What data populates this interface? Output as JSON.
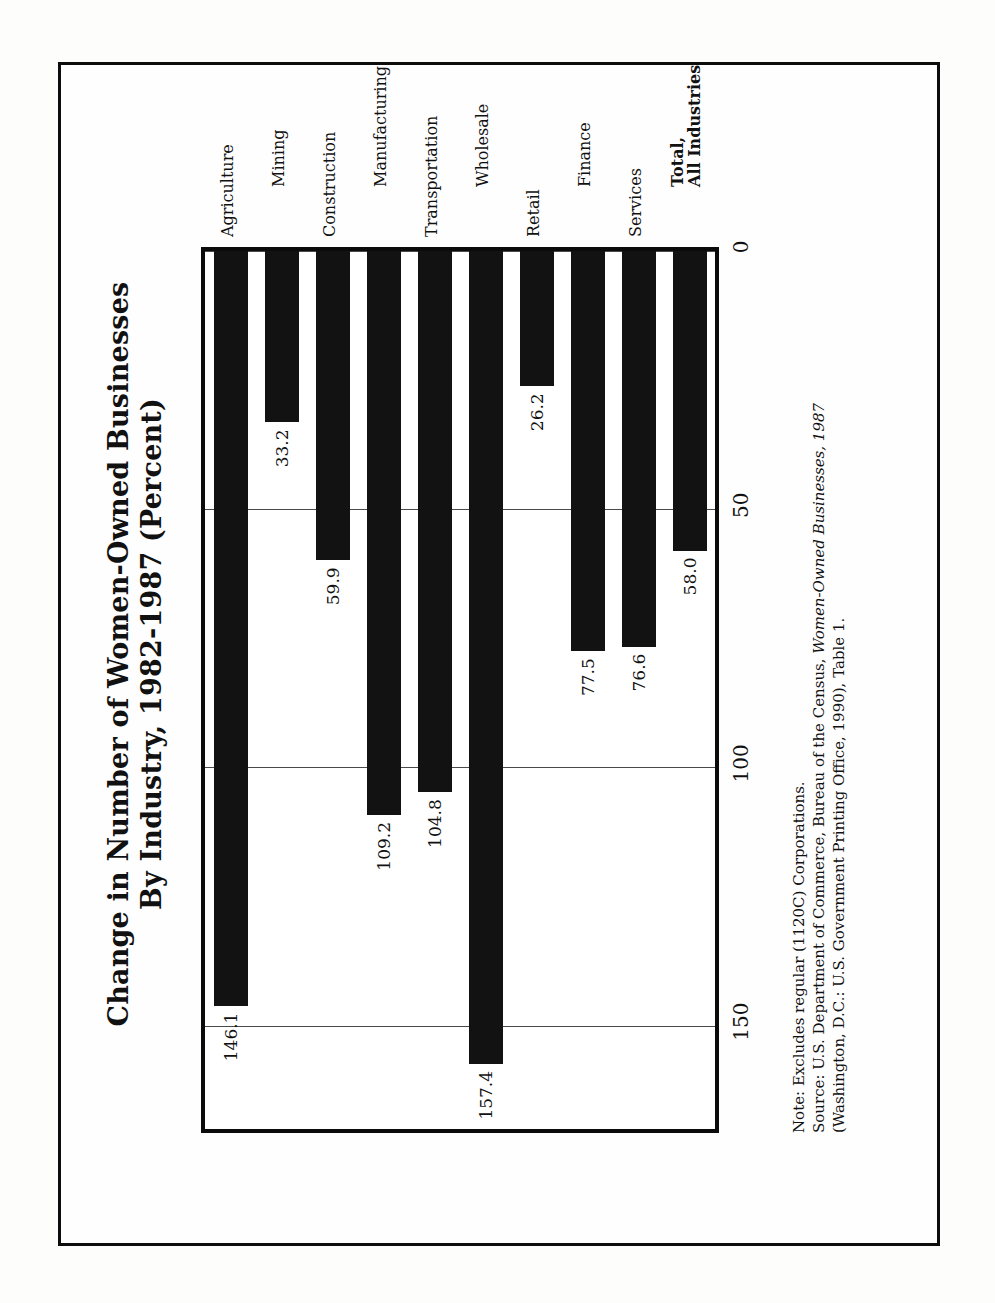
{
  "figure": {
    "title_line1": "Change in Number of Women-Owned Businesses",
    "title_line2": "By Industry, 1982-1987 (Percent)"
  },
  "notes": {
    "note": "Note: Excludes regular (1120C) Corporations.",
    "source_prefix": "Source: U.S. Department of Commerce, Bureau of the Census, ",
    "source_italic": "Women-Owned Businesses, 1987",
    "source_line2": "(Washington, D.C.: U.S. Government Printing Office, 1990), Table 1."
  },
  "chart_data": {
    "type": "bar",
    "orientation": "horizontal",
    "title": "Change in Number of Women-Owned Businesses By Industry, 1982-1987 (Percent)",
    "xlabel": "",
    "ylabel": "",
    "grid": true,
    "legend": "none",
    "axis_ticks": [
      "150",
      "100",
      "50",
      "0"
    ],
    "axis_tick_values": [
      150,
      100,
      50,
      0
    ],
    "xlim": [
      0,
      170
    ],
    "categories": [
      "Agriculture",
      "Mining",
      "Construction",
      "Manufacturing",
      "Transportation",
      "Wholesale",
      "Retail",
      "Finance",
      "Services",
      "Total,\nAll Industries"
    ],
    "values": [
      146.1,
      33.2,
      59.9,
      109.2,
      104.8,
      157.4,
      26.2,
      77.5,
      76.6,
      58.0
    ],
    "data_labels": [
      "146.1",
      "33.2",
      "59.9",
      "109.2",
      "104.8",
      "157.4",
      "26.2",
      "77.5",
      "76.6",
      "58.0"
    ],
    "bar_color": "#121212",
    "categories_display": [
      {
        "label": "Agriculture",
        "row": 1,
        "bold": false
      },
      {
        "label": "Mining",
        "row": 2,
        "bold": false
      },
      {
        "label": "Construction",
        "row": 1,
        "bold": false
      },
      {
        "label": "Manufacturing",
        "row": 2,
        "bold": false
      },
      {
        "label": "Transportation",
        "row": 1,
        "bold": false
      },
      {
        "label": "Wholesale",
        "row": 2,
        "bold": false
      },
      {
        "label": "Retail",
        "row": 1,
        "bold": false
      },
      {
        "label": "Finance",
        "row": 2,
        "bold": false
      },
      {
        "label": "Services",
        "row": 1,
        "bold": false
      },
      {
        "label": "Total,|All Industries",
        "row": 2,
        "bold": true
      }
    ]
  }
}
